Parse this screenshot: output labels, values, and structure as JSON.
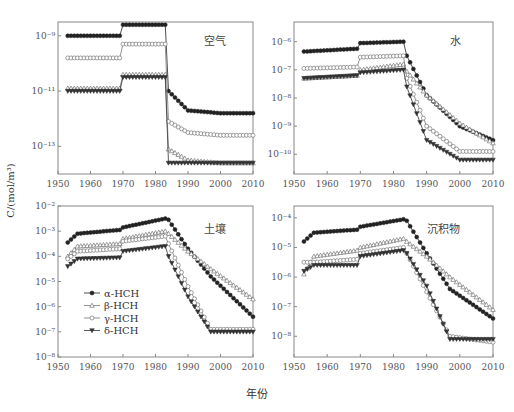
{
  "figure": {
    "xlabel": "年份",
    "ylabel": "C/(mol/m³)"
  },
  "legend": [
    {
      "name": "α-HCH",
      "marker": "filled-circle"
    },
    {
      "name": "β-HCH",
      "marker": "open-triangle-up"
    },
    {
      "name": "γ-HCH",
      "marker": "open-circle"
    },
    {
      "name": "δ-HCH",
      "marker": "filled-triangle-down"
    }
  ],
  "chart_data": [
    {
      "type": "line",
      "title": "空气",
      "xlabel": "年份",
      "ylabel": "C/(mol/m³)",
      "yscale": "log",
      "xlim": [
        1950,
        2010
      ],
      "xticks": [
        1950,
        1960,
        1970,
        1980,
        1990,
        2000,
        2010
      ],
      "ylim_exp": [
        -14,
        -8.5
      ],
      "yticks": [
        "10^-9",
        "10^-11",
        "10^-13"
      ],
      "x": [
        1953,
        1969,
        1970,
        1983,
        1984,
        1990,
        2000,
        2010
      ],
      "series": [
        {
          "name": "α-HCH",
          "log10": [
            -9,
            -9,
            -8.6,
            -8.6,
            -11.0,
            -11.7,
            -11.8,
            -11.8
          ]
        },
        {
          "name": "β-HCH",
          "log10": [
            -10.9,
            -10.9,
            -10.4,
            -10.4,
            -13.1,
            -13.5,
            -13.6,
            -13.6
          ]
        },
        {
          "name": "γ-HCH",
          "log10": [
            -9.8,
            -9.8,
            -9.3,
            -9.3,
            -12.1,
            -12.5,
            -12.6,
            -12.6
          ]
        },
        {
          "name": "δ-HCH",
          "log10": [
            -11.0,
            -11.0,
            -10.5,
            -10.5,
            -13.6,
            -13.6,
            -13.6,
            -13.6
          ]
        }
      ]
    },
    {
      "type": "line",
      "title": "水",
      "yscale": "log",
      "xlim": [
        1950,
        2010
      ],
      "xticks": [
        1950,
        1960,
        1970,
        1980,
        1990,
        2000,
        2010
      ],
      "ylim_exp": [
        -10.7,
        -5.3
      ],
      "yticks": [
        "10^-6",
        "10^-7",
        "10^-8",
        "10^-9",
        "10^-10"
      ],
      "x": [
        1953,
        1969,
        1970,
        1983,
        1984,
        1990,
        2000,
        2010
      ],
      "series": [
        {
          "name": "α-HCH",
          "log10": [
            -6.35,
            -6.25,
            -6.05,
            -6.0,
            -6.5,
            -7.9,
            -9.0,
            -9.5
          ]
        },
        {
          "name": "β-HCH",
          "log10": [
            -7.3,
            -7.2,
            -7.0,
            -6.8,
            -7.05,
            -7.9,
            -8.9,
            -9.6
          ]
        },
        {
          "name": "γ-HCH",
          "log10": [
            -6.95,
            -6.9,
            -6.55,
            -6.5,
            -7.3,
            -9.0,
            -9.9,
            -9.9
          ]
        },
        {
          "name": "δ-HCH",
          "log10": [
            -7.3,
            -7.2,
            -7.1,
            -7.0,
            -7.6,
            -9.5,
            -10.2,
            -10.2
          ]
        }
      ]
    },
    {
      "type": "line",
      "title": "土壤",
      "yscale": "log",
      "xlim": [
        1950,
        2010
      ],
      "xticks": [
        1950,
        1960,
        1970,
        1980,
        1990,
        2000,
        2010
      ],
      "ylim_exp": [
        -8,
        -2
      ],
      "yticks": [
        "10^-2",
        "10^-3",
        "10^-4",
        "10^-5",
        "10^-6",
        "10^-7",
        "10^-8"
      ],
      "x": [
        1953,
        1956,
        1969,
        1970,
        1983,
        1984,
        1990,
        1997,
        2010
      ],
      "series": [
        {
          "name": "α-HCH",
          "log10": [
            -3.45,
            -3.1,
            -2.95,
            -2.85,
            -2.5,
            -2.55,
            -3.7,
            -4.8,
            -6.4
          ]
        },
        {
          "name": "β-HCH",
          "log10": [
            -4.0,
            -3.6,
            -3.5,
            -3.3,
            -3.0,
            -3.1,
            -3.8,
            -4.5,
            -5.7
          ]
        },
        {
          "name": "γ-HCH",
          "log10": [
            -4.1,
            -3.8,
            -3.7,
            -3.4,
            -3.2,
            -3.5,
            -5.2,
            -6.9,
            -6.9
          ]
        },
        {
          "name": "δ-HCH",
          "log10": [
            -4.4,
            -4.1,
            -4.05,
            -3.8,
            -3.6,
            -4.0,
            -5.6,
            -7.0,
            -7.0
          ]
        }
      ]
    },
    {
      "type": "line",
      "title": "沉积物",
      "yscale": "log",
      "xlim": [
        1950,
        2010
      ],
      "xticks": [
        1950,
        1960,
        1970,
        1980,
        1990,
        2000,
        2010
      ],
      "ylim_exp": [
        -8.7,
        -3.6
      ],
      "yticks": [
        "10^-4",
        "10^-5",
        "10^-6",
        "10^-7",
        "10^-8"
      ],
      "x": [
        1953,
        1956,
        1969,
        1970,
        1983,
        1984,
        1990,
        1997,
        2010
      ],
      "series": [
        {
          "name": "α-HCH",
          "log10": [
            -4.8,
            -4.5,
            -4.4,
            -4.3,
            -4.05,
            -4.1,
            -5.2,
            -6.4,
            -7.4
          ]
        },
        {
          "name": "β-HCH",
          "log10": [
            -5.9,
            -5.3,
            -5.1,
            -5.0,
            -4.7,
            -4.8,
            -5.3,
            -6.0,
            -7.1
          ]
        },
        {
          "name": "γ-HCH",
          "log10": [
            -5.5,
            -5.5,
            -5.4,
            -5.2,
            -5.0,
            -5.2,
            -6.5,
            -8.0,
            -8.2
          ]
        },
        {
          "name": "δ-HCH",
          "log10": [
            -5.8,
            -5.6,
            -5.6,
            -5.3,
            -5.1,
            -5.2,
            -6.3,
            -8.1,
            -8.1
          ]
        }
      ]
    }
  ]
}
